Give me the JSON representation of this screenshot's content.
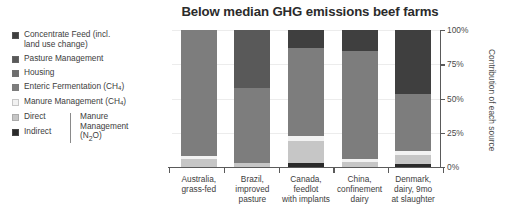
{
  "chart_data": {
    "type": "bar",
    "subtype": "stacked-bar-100-percent",
    "title": "Below median GHG emissions beef farms",
    "xlabel": "",
    "ylabel": "Contribution of each source",
    "ylim": [
      0,
      100
    ],
    "ytick_labels": [
      "0%",
      "25%",
      "50%",
      "75%",
      "100%"
    ],
    "ytick_values": [
      0,
      25,
      50,
      75,
      100
    ],
    "grid": true,
    "legend_position": "left",
    "categories": [
      "Australia, grass-fed",
      "Brazil, improved pasture",
      "Canada, feedlot with implants",
      "China, confinement dairy",
      "Denmark, dairy, 9mo at slaughter"
    ],
    "series": [
      {
        "name": "Concentrate Feed (incl. land use change)",
        "color": "#3f3f3f",
        "values": [
          0,
          0,
          13,
          15,
          47
        ]
      },
      {
        "name": "Pasture Management",
        "color": "#595959",
        "values": [
          0,
          42,
          0,
          0,
          0
        ]
      },
      {
        "name": "Housing",
        "color": "#6e6e6e",
        "values": [
          0,
          0,
          0,
          0,
          0
        ]
      },
      {
        "name": "Enteric Fermentation (CH4)",
        "color": "#7d7d7d",
        "values": [
          92,
          55,
          64,
          79,
          41
        ]
      },
      {
        "name": "Manure Management (CH4)",
        "color": "#f2f2f2",
        "values": [
          2,
          0,
          4,
          2,
          3
        ]
      },
      {
        "name": "Direct",
        "color": "#c6c6c6",
        "values": [
          6,
          3,
          16,
          4,
          7
        ]
      },
      {
        "name": "Indirect",
        "color": "#2a2a2a",
        "values": [
          0,
          0,
          3,
          0,
          2
        ]
      }
    ],
    "legend_entries": [
      {
        "label": "Concentrate Feed (incl. land use change)",
        "color": "#3f3f3f",
        "bracket": false
      },
      {
        "label": "Pasture Management",
        "color": "#595959",
        "bracket": false
      },
      {
        "label": "Housing",
        "color": "#6e6e6e",
        "bracket": false
      },
      {
        "label": "Enteric Fermentation (CH₄)",
        "color": "#7d7d7d",
        "bracket": false
      },
      {
        "label": "Manure Management (CH₄)",
        "color": "#f2f2f2",
        "bracket": false
      },
      {
        "label": "Direct",
        "color": "#c6c6c6",
        "bracket": true
      },
      {
        "label": "Indirect",
        "color": "#2a2a2a",
        "bracket": true
      }
    ],
    "bracket_label": "Manure Management (N₂O)"
  },
  "title": "Below median GHG emissions beef farms",
  "legend": {
    "item1": "Concentrate Feed (incl. land use change)",
    "item1_line1": "Concentrate Feed (incl.",
    "item1_line2": "land use change)",
    "item2": "Pasture Management",
    "item3": "Housing",
    "item4_main": "Enteric Fermentation (CH",
    "item4_sub": "4",
    "item4_tail": ")",
    "item5_main": "Manure Management (CH",
    "item5_sub": "4",
    "item5_tail": ")",
    "item6": "Direct",
    "item7": "Indirect",
    "bracket_line1": "Manure",
    "bracket_line2": "Management",
    "bracket_line3_main": "(N",
    "bracket_line3_sub": "2",
    "bracket_line3_tail": "O)"
  },
  "yaxis": {
    "title": "Contribution of each source",
    "ticks": [
      "100%",
      "75%",
      "50%",
      "25%",
      "0%"
    ]
  },
  "xaxis": {
    "labels": [
      {
        "line1": "Australia,",
        "line2": "grass-fed",
        "line3": ""
      },
      {
        "line1": "Brazil,",
        "line2": "improved",
        "line3": "pasture"
      },
      {
        "line1": "Canada,",
        "line2": "feedlot",
        "line3": "with implants"
      },
      {
        "line1": "China,",
        "line2": "confinement",
        "line3": "dairy"
      },
      {
        "line1": "Denmark,",
        "line2": "dairy, 9mo",
        "line3": "at slaughter"
      }
    ]
  },
  "colors": {
    "concentrate_feed": "#3f3f3f",
    "pasture_management": "#595959",
    "housing": "#6e6e6e",
    "enteric_fermentation": "#7d7d7d",
    "manure_ch4": "#f2f2f2",
    "direct": "#c6c6c6",
    "indirect": "#2a2a2a",
    "axis": "#5a5a5a",
    "grid": "#ececec",
    "background": "#ffffff"
  }
}
